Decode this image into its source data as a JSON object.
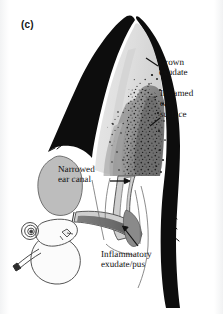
{
  "figure": {
    "panel_label": "(c)",
    "background_color": "#fdfdfd",
    "ink_color": "#111111"
  },
  "palette": {
    "outline_black": "#0d0d0d",
    "pinna_light": "#e3e3e3",
    "pinna_light_2": "#d7d7d7",
    "inflamed_mid_gray": "#9a9a9a",
    "inflamed_dark_gray": "#7b7b7b",
    "brown_exudate_gray": "#8d8d8d",
    "cartilage_gray": "#bdbdbd",
    "pus_gray": "#6f6f6f",
    "canal_lining": "#c9c9c9",
    "white_fill": "#fbfbfb",
    "speckle": "#141414"
  },
  "annotations": [
    {
      "id": "brown-exudate",
      "text": "Brown\nexudate",
      "points_to": "dark speckled discharge on upper inner pinna",
      "leader": "diagonal line up-left"
    },
    {
      "id": "inflamed-ear-surface",
      "text": "Inflamed\near\nsurface",
      "points_to": "thickened reddened inner pinna surface",
      "leader": "short line down-left"
    },
    {
      "id": "narrowed-ear-canal",
      "text": "Narrowed\near canal",
      "points_to": "stenotic vertical ear canal",
      "leader": "horizontal arrow pointing right"
    },
    {
      "id": "inflammatory-exudate-pus",
      "text": "Inflammatory\nexudate/pus",
      "points_to": "pus filling the horizontal ear canal",
      "leader": "arrow pointing up-left"
    }
  ],
  "anatomy": [
    "pinna tip",
    "pinna inner surface",
    "auricular cartilage",
    "vertical ear canal",
    "horizontal ear canal",
    "tympanic bulla",
    "cochlea",
    "auditory ossicles",
    "eustachian tube"
  ]
}
